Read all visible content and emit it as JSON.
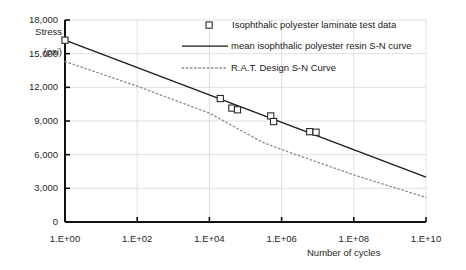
{
  "chart_data": {
    "type": "line",
    "title": "",
    "xlabel": "Number of cycles",
    "ylabel_line1": "Stress",
    "ylabel_line2": "(psi)",
    "x_scale": "log",
    "y_scale": "linear",
    "xlim": [
      1,
      10000000000
    ],
    "ylim": [
      0,
      18000
    ],
    "grid": true,
    "legend_position": "top-right",
    "xticks": [
      "1.E+00",
      "1.E+02",
      "1.E+04",
      "1.E+06",
      "1.E+08",
      "1.E+10"
    ],
    "xtick_values": [
      1,
      100,
      10000,
      1000000,
      100000000,
      10000000000
    ],
    "yticks": [
      "0",
      "3,000",
      "6,000",
      "9,000",
      "12,000",
      "15,000",
      "18,000"
    ],
    "ytick_values": [
      0,
      3000,
      6000,
      9000,
      12000,
      15000,
      18000
    ],
    "series": [
      {
        "name": "Isophthalic polyester laminate test data",
        "type": "scatter",
        "marker": "open-square",
        "color": "#2b2b2b",
        "points": [
          {
            "x": 1,
            "y": 16200
          },
          {
            "x": 20000,
            "y": 11000
          },
          {
            "x": 42000,
            "y": 10150
          },
          {
            "x": 60000,
            "y": 10000
          },
          {
            "x": 500000,
            "y": 9450
          },
          {
            "x": 600000,
            "y": 8950
          },
          {
            "x": 6000000,
            "y": 8050
          },
          {
            "x": 9000000,
            "y": 8000
          }
        ]
      },
      {
        "name": "mean isophthalic polyester resin S-N curve",
        "type": "line",
        "style": "solid",
        "color": "#1a1a1a",
        "points": [
          {
            "x": 1,
            "y": 16200
          },
          {
            "x": 10000000000,
            "y": 4000
          }
        ]
      },
      {
        "name": "R.A.T. Design S-N Curve",
        "type": "line",
        "style": "dotted",
        "color": "#8c8c8c",
        "points": [
          {
            "x": 1,
            "y": 14300
          },
          {
            "x": 100,
            "y": 12100
          },
          {
            "x": 10000,
            "y": 9700
          },
          {
            "x": 300000,
            "y": 7100
          },
          {
            "x": 1500000,
            "y": 6250
          },
          {
            "x": 100000000,
            "y": 4200
          },
          {
            "x": 10000000000,
            "y": 2200
          }
        ]
      }
    ]
  },
  "legend": {
    "items": [
      {
        "label": "Isophthalic polyester laminate test data",
        "marker": "open-square"
      },
      {
        "label": "mean isophthalic polyester resin S-N curve",
        "marker": "solid-line"
      },
      {
        "label": "R.A.T. Design S-N Curve",
        "marker": "dotted-line"
      }
    ]
  }
}
